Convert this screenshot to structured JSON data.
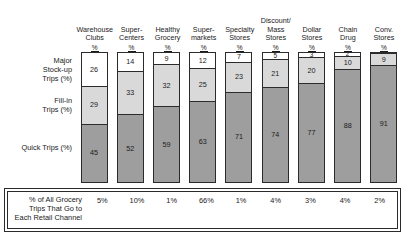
{
  "chart_data": {
    "type": "bar",
    "subtype": "stacked-100-percent-column",
    "title": "",
    "xlabel": "",
    "ylabel": "",
    "ylim": [
      0,
      100
    ],
    "grid": false,
    "legend_position": "left-row-labels",
    "categories": [
      "Warehouse Clubs",
      "Super-Centers",
      "Healthy Grocery",
      "Super-markets",
      "Specialty Stores",
      "Discount/ Mass Stores",
      "Dollar Stores",
      "Chain Drug",
      "Conv. Stores"
    ],
    "series": [
      {
        "name": "Major Stock-up Trips (%)",
        "values": [
          26,
          14,
          9,
          12,
          7,
          5,
          3,
          2,
          0
        ]
      },
      {
        "name": "Fill-in Trips (%)",
        "values": [
          29,
          33,
          32,
          25,
          23,
          21,
          20,
          10,
          9
        ]
      },
      {
        "name": "Quick Trips (%)",
        "values": [
          45,
          52,
          59,
          63,
          71,
          74,
          77,
          88,
          91
        ]
      }
    ],
    "footer_label": "% of All Grocery Trips That Go to Each Retail Channel",
    "footer_values": [
      "5%",
      "10%",
      "1%",
      "66%",
      "1%",
      "4%",
      "3%",
      "4%",
      "2%"
    ],
    "colors": {
      "major": "#ffffff",
      "fillin": "#d9d9d9",
      "quick": "#9e9e9e",
      "outline": "#2b2b2b",
      "text": "#1a1a1a"
    }
  },
  "columns": [
    {
      "line1": "Warehouse",
      "line2": "Clubs",
      "unit": "%",
      "major": "26",
      "fillin": "29",
      "quick": "45",
      "share": "5%"
    },
    {
      "line1": "Super-",
      "line2": "Centers",
      "unit": "%",
      "major": "14",
      "fillin": "33",
      "quick": "52",
      "share": "10%"
    },
    {
      "line1": "Healthy",
      "line2": "Grocery",
      "unit": "%",
      "major": "9",
      "fillin": "32",
      "quick": "59",
      "share": "1%"
    },
    {
      "line1": "Super-",
      "line2": "markets",
      "unit": "%",
      "major": "12",
      "fillin": "25",
      "quick": "63",
      "share": "66%"
    },
    {
      "line1": "Specialty",
      "line2": "Stores",
      "unit": "%",
      "major": "7",
      "fillin": "23",
      "quick": "71",
      "share": "1%"
    },
    {
      "line1": "Discount/",
      "line2": "Mass",
      "line3": "Stores",
      "unit": "%",
      "major": "5",
      "fillin": "21",
      "quick": "74",
      "share": "4%"
    },
    {
      "line1": "Dollar",
      "line2": "Stores",
      "unit": "%",
      "major": "3",
      "fillin": "20",
      "quick": "77",
      "share": "3%"
    },
    {
      "line1": "Chain",
      "line2": "Drug",
      "unit": "%",
      "major": "2",
      "fillin": "10",
      "quick": "88",
      "share": "4%"
    },
    {
      "line1": "Conv.",
      "line2": "Stores",
      "unit": "%",
      "major": "",
      "fillin": "9",
      "quick": "91",
      "share": "2%"
    }
  ],
  "row_labels": {
    "major_l1": "Major",
    "major_l2": "Stock-up",
    "major_l3": "Trips (%)",
    "fillin_l1": "Fill-in",
    "fillin_l2": "Trips (%)",
    "quick_l1": "Quick Trips (%)"
  },
  "footer": {
    "caption_l1": "% of All Grocery",
    "caption_l2": "Trips That Go to",
    "caption_l3": "Each Retail Channel"
  }
}
